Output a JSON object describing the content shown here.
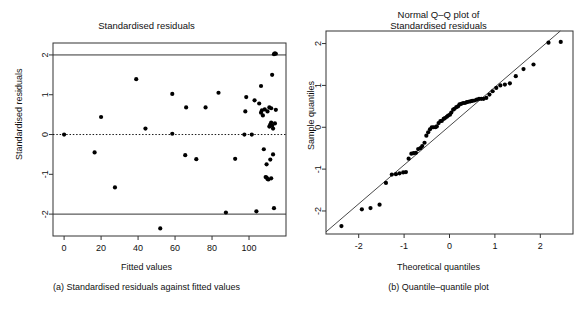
{
  "figure": {
    "panels": [
      {
        "id": "a",
        "title": "Standardised residuals",
        "caption": "(a) Standardised residuals against fitted values",
        "xlabel": "Fitted values",
        "ylabel": "Standardised residuals"
      },
      {
        "id": "b",
        "title_line1": "Normal Q–Q plot of",
        "title_line2": "Standardised residuals",
        "caption": "(b) Quantile–quantile plot",
        "xlabel": "Theoretical quantiles",
        "ylabel": "Sample quantiles"
      }
    ]
  },
  "colors": {
    "point": "#000000",
    "axis": "#333333",
    "reference_line": "#333333",
    "zero_line": "#000000",
    "background": "#ffffff"
  },
  "chart_data": [
    {
      "type": "scatter",
      "title": "Standardised residuals",
      "xlabel": "Fitted values",
      "ylabel": "Standardised residuals",
      "xlim": [
        -6,
        120
      ],
      "ylim": [
        -2.55,
        2.3
      ],
      "xticks": [
        0,
        20,
        40,
        60,
        80,
        100
      ],
      "yticks": [
        2,
        1,
        0,
        -1,
        -2
      ],
      "grid": false,
      "legend": null,
      "reference_lines": [
        {
          "y": 2,
          "style": "solid"
        },
        {
          "y": 0,
          "style": "dotted"
        },
        {
          "y": -2,
          "style": "solid"
        }
      ],
      "points": [
        [
          0.0,
          0.0
        ],
        [
          16.5,
          -0.45
        ],
        [
          20.0,
          0.44
        ],
        [
          27.5,
          -1.33
        ],
        [
          39.0,
          1.39
        ],
        [
          44.0,
          0.15
        ],
        [
          52.0,
          -2.36
        ],
        [
          58.5,
          0.02
        ],
        [
          58.5,
          1.02
        ],
        [
          65.5,
          -0.52
        ],
        [
          66.0,
          0.68
        ],
        [
          71.5,
          -0.62
        ],
        [
          76.5,
          0.68
        ],
        [
          83.5,
          1.05
        ],
        [
          87.5,
          -1.96
        ],
        [
          92.5,
          -0.61
        ],
        [
          97.5,
          0.0
        ],
        [
          98.0,
          0.58
        ],
        [
          98.5,
          0.94
        ],
        [
          101.5,
          0.0
        ],
        [
          103.0,
          0.86
        ],
        [
          104.0,
          -1.93
        ],
        [
          105.5,
          0.78
        ],
        [
          106.5,
          0.55
        ],
        [
          106.5,
          1.22
        ],
        [
          107.0,
          0.61
        ],
        [
          107.5,
          0.48
        ],
        [
          108.0,
          -0.37
        ],
        [
          108.5,
          0.63
        ],
        [
          109.0,
          -1.07
        ],
        [
          109.5,
          -1.08
        ],
        [
          109.5,
          -0.75
        ],
        [
          110.0,
          -1.12
        ],
        [
          110.0,
          0.58
        ],
        [
          110.5,
          -1.13
        ],
        [
          111.0,
          0.2
        ],
        [
          111.0,
          0.68
        ],
        [
          111.5,
          0.25
        ],
        [
          111.5,
          -0.63
        ],
        [
          112.0,
          0.3
        ],
        [
          112.0,
          0.66
        ],
        [
          112.0,
          -1.1
        ],
        [
          112.5,
          0.22
        ],
        [
          112.5,
          1.5
        ],
        [
          113.0,
          0.15
        ],
        [
          113.0,
          -0.5
        ],
        [
          113.5,
          2.02
        ],
        [
          113.5,
          -1.85
        ],
        [
          114.0,
          2.04
        ],
        [
          114.0,
          0.28
        ],
        [
          114.5,
          2.03
        ],
        [
          114.5,
          0.62
        ]
      ]
    },
    {
      "type": "scatter",
      "title": "Normal Q–Q plot of Standardised residuals",
      "xlabel": "Theoretical quantiles",
      "ylabel": "Sample quantiles",
      "xlim": [
        -2.72,
        2.72
      ],
      "ylim": [
        -2.55,
        2.3
      ],
      "xticks": [
        -2,
        -1,
        0,
        1,
        2
      ],
      "yticks": [
        2,
        1,
        0,
        -1,
        -2
      ],
      "grid": false,
      "legend": null,
      "reference_line": {
        "intercept": 0.03,
        "slope": 0.93,
        "style": "solid"
      },
      "points": [
        [
          -2.38,
          -2.36
        ],
        [
          -1.93,
          -1.96
        ],
        [
          -1.74,
          -1.93
        ],
        [
          -1.54,
          -1.85
        ],
        [
          -1.4,
          -1.33
        ],
        [
          -1.27,
          -1.13
        ],
        [
          -1.18,
          -1.12
        ],
        [
          -1.1,
          -1.1
        ],
        [
          -1.02,
          -1.08
        ],
        [
          -0.96,
          -1.07
        ],
        [
          -0.9,
          -0.75
        ],
        [
          -0.84,
          -0.63
        ],
        [
          -0.79,
          -0.62
        ],
        [
          -0.74,
          -0.61
        ],
        [
          -0.69,
          -0.52
        ],
        [
          -0.64,
          -0.5
        ],
        [
          -0.6,
          -0.45
        ],
        [
          -0.55,
          -0.37
        ],
        [
          -0.51,
          -0.2
        ],
        [
          -0.47,
          -0.12
        ],
        [
          -0.43,
          -0.05
        ],
        [
          -0.39,
          0.0
        ],
        [
          -0.35,
          0.0
        ],
        [
          -0.31,
          0.0
        ],
        [
          -0.28,
          0.02
        ],
        [
          -0.24,
          0.1
        ],
        [
          -0.2,
          0.15
        ],
        [
          -0.17,
          0.15
        ],
        [
          -0.13,
          0.2
        ],
        [
          -0.1,
          0.22
        ],
        [
          -0.06,
          0.25
        ],
        [
          -0.03,
          0.28
        ],
        [
          0.01,
          0.3
        ],
        [
          0.04,
          0.35
        ],
        [
          0.08,
          0.42
        ],
        [
          0.11,
          0.44
        ],
        [
          0.15,
          0.48
        ],
        [
          0.19,
          0.5
        ],
        [
          0.22,
          0.55
        ],
        [
          0.26,
          0.56
        ],
        [
          0.3,
          0.58
        ],
        [
          0.34,
          0.58
        ],
        [
          0.38,
          0.6
        ],
        [
          0.42,
          0.61
        ],
        [
          0.46,
          0.62
        ],
        [
          0.5,
          0.63
        ],
        [
          0.55,
          0.64
        ],
        [
          0.6,
          0.66
        ],
        [
          0.65,
          0.68
        ],
        [
          0.7,
          0.68
        ],
        [
          0.75,
          0.68
        ],
        [
          0.81,
          0.7
        ],
        [
          0.88,
          0.78
        ],
        [
          0.95,
          0.86
        ],
        [
          1.03,
          0.94
        ],
        [
          1.12,
          1.0
        ],
        [
          1.22,
          1.02
        ],
        [
          1.33,
          1.05
        ],
        [
          1.46,
          1.22
        ],
        [
          1.63,
          1.39
        ],
        [
          1.85,
          1.5
        ],
        [
          2.18,
          2.02
        ],
        [
          2.45,
          2.04
        ]
      ]
    }
  ]
}
